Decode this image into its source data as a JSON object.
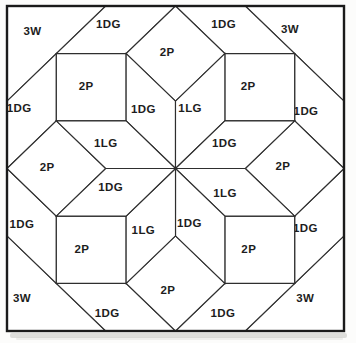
{
  "diagram": {
    "kind": "quilt-block-piecing-diagram",
    "colors": {
      "page_background": "#fcfcfb",
      "paper": "#ffffff",
      "line": "#2e2e2e",
      "border": "#1a1a1a",
      "label": "#1d1d1d",
      "shadow": "#c2c2c0"
    },
    "geometry": {
      "center_px": [
        175.5,
        168.5
      ],
      "scale_px": [
        69.8,
        67.3
      ],
      "border_px": {
        "x": 7,
        "y": 6,
        "width": 337,
        "height": 325
      },
      "border_stroke_width": 2.4,
      "line_stroke_width": 1.15,
      "shadow_px": {
        "x": 10,
        "y": 333,
        "width": 337,
        "height": 5
      }
    },
    "label_codes": [
      "3W",
      "1DG",
      "2P",
      "1LG"
    ],
    "pieces": [
      {
        "name": "corner-triangle-nw",
        "label": "3W",
        "points": [
          [
            -2.4142,
            -2.4142
          ],
          [
            -1,
            -2.4142
          ],
          [
            -2.4142,
            -1
          ]
        ],
        "label_pos": [
          -2.05,
          -2.05
        ]
      },
      {
        "name": "corner-triangle-ne",
        "label": "3W",
        "points": [
          [
            1,
            -2.4142
          ],
          [
            2.4142,
            -2.4142
          ],
          [
            2.4142,
            -1
          ]
        ],
        "label_pos": [
          1.64,
          -2.08
        ]
      },
      {
        "name": "corner-triangle-se",
        "label": "3W",
        "points": [
          [
            2.4142,
            1
          ],
          [
            2.4142,
            2.4142
          ],
          [
            1,
            2.4142
          ]
        ],
        "label_pos": [
          1.86,
          1.93
        ]
      },
      {
        "name": "corner-triangle-sw",
        "label": "3W",
        "points": [
          [
            -2.4142,
            1
          ],
          [
            -1,
            2.4142
          ],
          [
            -2.4142,
            2.4142
          ]
        ],
        "label_pos": [
          -2.2,
          1.92
        ]
      },
      {
        "name": "edge-parallelogram-top-left",
        "label": "1DG",
        "points": [
          [
            -1,
            -2.4142
          ],
          [
            0,
            -2.4142
          ],
          [
            -0.7071,
            -1.7071
          ],
          [
            -1.7071,
            -1.7071
          ]
        ],
        "label_pos": [
          -0.96,
          -2.15
        ]
      },
      {
        "name": "edge-parallelogram-top-right",
        "label": "1DG",
        "points": [
          [
            0,
            -2.4142
          ],
          [
            1,
            -2.4142
          ],
          [
            1.7071,
            -1.7071
          ],
          [
            0.7071,
            -1.7071
          ]
        ],
        "label_pos": [
          0.69,
          -2.15
        ]
      },
      {
        "name": "edge-parallelogram-left-top",
        "label": "1DG",
        "points": [
          [
            -2.4142,
            -1
          ],
          [
            -2.4142,
            0
          ],
          [
            -1.7071,
            -0.7071
          ],
          [
            -1.7071,
            -1.7071
          ]
        ],
        "label_pos": [
          -2.24,
          -0.9
        ]
      },
      {
        "name": "edge-parallelogram-left-bottom",
        "label": "1DG",
        "points": [
          [
            -2.4142,
            0
          ],
          [
            -2.4142,
            1
          ],
          [
            -1.7071,
            1.7071
          ],
          [
            -1.7071,
            0.7071
          ]
        ],
        "label_pos": [
          -2.2,
          0.82
        ]
      },
      {
        "name": "edge-parallelogram-right-top",
        "label": "1DG",
        "points": [
          [
            2.4142,
            -1
          ],
          [
            2.4142,
            0
          ],
          [
            1.7071,
            -0.7071
          ],
          [
            1.7071,
            -1.7071
          ]
        ],
        "label_pos": [
          1.87,
          -0.86
        ]
      },
      {
        "name": "edge-parallelogram-right-bottom",
        "label": "1DG",
        "points": [
          [
            2.4142,
            0
          ],
          [
            2.4142,
            1
          ],
          [
            1.7071,
            1.7071
          ],
          [
            1.7071,
            0.7071
          ]
        ],
        "label_pos": [
          1.86,
          0.88
        ]
      },
      {
        "name": "edge-parallelogram-bottom-left",
        "label": "1DG",
        "points": [
          [
            -1,
            2.4142
          ],
          [
            0,
            2.4142
          ],
          [
            -0.7071,
            1.7071
          ],
          [
            -1.7071,
            1.7071
          ]
        ],
        "label_pos": [
          -0.98,
          2.14
        ]
      },
      {
        "name": "edge-parallelogram-bottom-right",
        "label": "1DG",
        "points": [
          [
            0,
            2.4142
          ],
          [
            1,
            2.4142
          ],
          [
            1.7071,
            1.7071
          ],
          [
            0.7071,
            1.7071
          ]
        ],
        "label_pos": [
          0.68,
          2.14
        ]
      },
      {
        "name": "square-nw",
        "label": "2P",
        "points": [
          [
            -1.7071,
            -1.7071
          ],
          [
            -0.7071,
            -1.7071
          ],
          [
            -0.7071,
            -0.7071
          ],
          [
            -1.7071,
            -0.7071
          ]
        ],
        "label_pos": [
          -1.28,
          -1.22
        ]
      },
      {
        "name": "square-ne",
        "label": "2P",
        "points": [
          [
            0.7071,
            -1.7071
          ],
          [
            1.7071,
            -1.7071
          ],
          [
            1.7071,
            -0.7071
          ],
          [
            0.7071,
            -0.7071
          ]
        ],
        "label_pos": [
          1.04,
          -1.23
        ]
      },
      {
        "name": "square-se",
        "label": "2P",
        "points": [
          [
            0.7071,
            0.7071
          ],
          [
            1.7071,
            0.7071
          ],
          [
            1.7071,
            1.7071
          ],
          [
            0.7071,
            1.7071
          ]
        ],
        "label_pos": [
          1.05,
          1.2
        ]
      },
      {
        "name": "square-sw",
        "label": "2P",
        "points": [
          [
            -1.7071,
            0.7071
          ],
          [
            -0.7071,
            0.7071
          ],
          [
            -0.7071,
            1.7071
          ],
          [
            -1.7071,
            1.7071
          ]
        ],
        "label_pos": [
          -1.34,
          1.2
        ]
      },
      {
        "name": "onpoint-square-north",
        "label": "2P",
        "points": [
          [
            0,
            -1
          ],
          [
            -0.7071,
            -1.7071
          ],
          [
            0,
            -2.4142
          ],
          [
            0.7071,
            -1.7071
          ]
        ],
        "label_pos": [
          -0.12,
          -1.73
        ]
      },
      {
        "name": "onpoint-square-east",
        "label": "2P",
        "points": [
          [
            1,
            0
          ],
          [
            1.7071,
            -0.7071
          ],
          [
            2.4142,
            0
          ],
          [
            1.7071,
            0.7071
          ]
        ],
        "label_pos": [
          1.54,
          -0.03
        ]
      },
      {
        "name": "onpoint-square-south",
        "label": "2P",
        "points": [
          [
            0,
            1
          ],
          [
            0.7071,
            1.7071
          ],
          [
            0,
            2.4142
          ],
          [
            -0.7071,
            1.7071
          ]
        ],
        "label_pos": [
          -0.11,
          1.8
        ]
      },
      {
        "name": "onpoint-square-west",
        "label": "2P",
        "points": [
          [
            -1,
            0
          ],
          [
            -1.7071,
            0.7071
          ],
          [
            -2.4142,
            0
          ],
          [
            -1.7071,
            -0.7071
          ]
        ],
        "label_pos": [
          -1.84,
          -0.02
        ]
      },
      {
        "name": "star-diamond-n-nw",
        "label": "1DG",
        "points": [
          [
            0,
            0
          ],
          [
            0,
            -1
          ],
          [
            -0.7071,
            -1.7071
          ],
          [
            -0.7071,
            -0.7071
          ]
        ],
        "label_pos": [
          -0.46,
          -0.89
        ]
      },
      {
        "name": "star-diamond-n-ne",
        "label": "1LG",
        "points": [
          [
            0,
            0
          ],
          [
            0,
            -1
          ],
          [
            0.7071,
            -1.7071
          ],
          [
            0.7071,
            -0.7071
          ]
        ],
        "label_pos": [
          0.21,
          -0.9
        ]
      },
      {
        "name": "star-diamond-e-ne",
        "label": "1DG",
        "points": [
          [
            0,
            0
          ],
          [
            1,
            0
          ],
          [
            1.7071,
            -0.7071
          ],
          [
            0.7071,
            -0.7071
          ]
        ],
        "label_pos": [
          0.7,
          -0.38
        ]
      },
      {
        "name": "star-diamond-e-se",
        "label": "1LG",
        "points": [
          [
            0,
            0
          ],
          [
            1,
            0
          ],
          [
            1.7071,
            0.7071
          ],
          [
            0.7071,
            0.7071
          ]
        ],
        "label_pos": [
          0.71,
          0.37
        ]
      },
      {
        "name": "star-diamond-s-se",
        "label": "1DG",
        "points": [
          [
            0,
            0
          ],
          [
            0,
            1
          ],
          [
            0.7071,
            1.7071
          ],
          [
            0.7071,
            0.7071
          ]
        ],
        "label_pos": [
          0.2,
          0.81
        ]
      },
      {
        "name": "star-diamond-s-sw",
        "label": "1LG",
        "points": [
          [
            0,
            0
          ],
          [
            0,
            1
          ],
          [
            -0.7071,
            1.7071
          ],
          [
            -0.7071,
            0.7071
          ]
        ],
        "label_pos": [
          -0.46,
          0.92
        ]
      },
      {
        "name": "star-diamond-w-sw",
        "label": "1DG",
        "points": [
          [
            0,
            0
          ],
          [
            -1,
            0
          ],
          [
            -1.7071,
            0.7071
          ],
          [
            -0.7071,
            0.7071
          ]
        ],
        "label_pos": [
          -0.93,
          0.28
        ]
      },
      {
        "name": "star-diamond-w-nw",
        "label": "1LG",
        "points": [
          [
            0,
            0
          ],
          [
            -1,
            0
          ],
          [
            -1.7071,
            -0.7071
          ],
          [
            -0.7071,
            -0.7071
          ]
        ],
        "label_pos": [
          -1.0,
          -0.38
        ]
      }
    ]
  }
}
